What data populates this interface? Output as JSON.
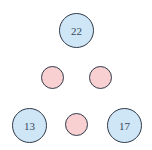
{
  "diagram": {
    "colors": {
      "value_node_fill": "#cfe6f7",
      "empty_node_fill": "#f9d0d2",
      "stroke": "#2f3a4a"
    },
    "nodes": [
      {
        "id": "top",
        "label": "22",
        "type": "value",
        "cx": 76,
        "cy": 30
      },
      {
        "id": "mid-left",
        "label": "",
        "type": "empty",
        "cx": 52,
        "cy": 77
      },
      {
        "id": "mid-right",
        "label": "",
        "type": "empty",
        "cx": 100,
        "cy": 77
      },
      {
        "id": "bottom-left",
        "label": "13",
        "type": "value",
        "cx": 29,
        "cy": 125
      },
      {
        "id": "bottom-middle",
        "label": "",
        "type": "empty",
        "cx": 76,
        "cy": 125
      },
      {
        "id": "bottom-right",
        "label": "17",
        "type": "value",
        "cx": 124,
        "cy": 125
      }
    ]
  }
}
